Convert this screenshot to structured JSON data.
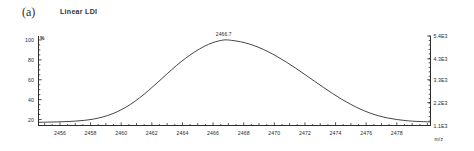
{
  "figure": {
    "panel_letter": "(a)",
    "title": "Linear LDI"
  },
  "chart_data": {
    "type": "line",
    "title": "Linear LDI",
    "xlabel": "m/z",
    "ylabel": "%",
    "y2label": "",
    "grid": false,
    "legend": null,
    "xlim": [
      2454.6,
      2480.2
    ],
    "ylim": [
      14,
      104
    ],
    "y2lim": [
      1100,
      5400
    ],
    "x_ticks": [
      2456,
      2458,
      2460,
      2462,
      2464,
      2466,
      2468,
      2470,
      2472,
      2474,
      2476,
      2478
    ],
    "x_tick_labels": [
      "2456",
      "2458",
      "2460",
      "2462",
      "2464",
      "2466",
      "2468",
      "2470",
      "2472",
      "2474",
      "2476",
      "2478"
    ],
    "y_ticks": [
      20,
      40,
      60,
      80,
      100
    ],
    "y_tick_labels": [
      "20",
      "40",
      "60",
      "80",
      "100"
    ],
    "y2_ticks": [
      1100,
      2200,
      3300,
      4300,
      5400
    ],
    "y2_tick_labels": [
      "1.1E3",
      "2.2E3",
      "3.3E3",
      "4.3E3",
      "5.4E3"
    ],
    "annotations": [
      {
        "text": "2466.7",
        "x": 2466.7,
        "y": 100
      }
    ],
    "series": [
      {
        "name": "Linear LDI ion signal",
        "color": "#303030",
        "x": [
          2454.6,
          2455.2,
          2455.8,
          2456.4,
          2457.0,
          2457.6,
          2458.2,
          2458.8,
          2459.4,
          2460.0,
          2460.6,
          2461.2,
          2461.8,
          2462.4,
          2463.0,
          2463.6,
          2464.2,
          2464.8,
          2465.4,
          2466.0,
          2466.7,
          2467.2,
          2467.8,
          2468.4,
          2469.0,
          2469.6,
          2470.2,
          2470.8,
          2471.4,
          2472.0,
          2472.6,
          2473.2,
          2473.8,
          2474.4,
          2475.0,
          2475.6,
          2476.2,
          2476.8,
          2477.4,
          2478.0,
          2478.6,
          2479.2,
          2480.2
        ],
        "y": [
          17.2,
          17.4,
          17.6,
          17.9,
          18.4,
          19.2,
          20.5,
          22.6,
          25.6,
          29.8,
          35.2,
          41.8,
          49.4,
          57.6,
          66.0,
          74.2,
          81.6,
          88.0,
          93.4,
          97.4,
          100.0,
          99.6,
          98.2,
          95.8,
          92.4,
          88.2,
          83.2,
          77.6,
          71.6,
          65.2,
          58.8,
          52.4,
          46.2,
          40.4,
          35.2,
          30.6,
          26.8,
          23.8,
          21.6,
          20.0,
          18.9,
          18.2,
          17.6
        ]
      }
    ]
  },
  "axes": {
    "percent_sign": "%",
    "mz_label": "m/z"
  }
}
